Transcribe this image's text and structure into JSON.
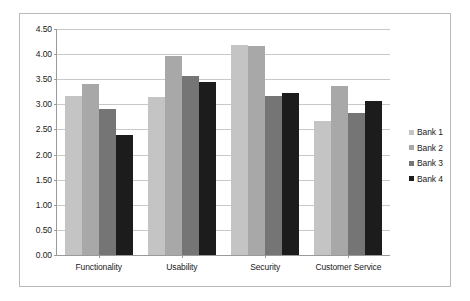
{
  "chart_data": {
    "type": "bar",
    "title": "",
    "subtitle": "",
    "xlabel": "",
    "ylabel": "",
    "ylim": [
      0,
      4.5
    ],
    "ytick_labels": [
      "4.50",
      "4.00",
      "3.50",
      "3.00",
      "2.50",
      "2.00",
      "1.50",
      "1.00",
      "0.50",
      "0.00"
    ],
    "ytick_values": [
      4.5,
      4.0,
      3.5,
      3.0,
      2.5,
      2.0,
      1.5,
      1.0,
      0.5,
      0.0
    ],
    "grid": true,
    "legend_position": "right",
    "categories": [
      "Functionality",
      "Usability",
      "Security",
      "Customer Service"
    ],
    "series": [
      {
        "name": "Bank 1",
        "color": "#c4c4c4",
        "values": [
          3.16,
          3.15,
          4.18,
          2.67
        ]
      },
      {
        "name": "Bank 2",
        "color": "#a8a8a8",
        "values": [
          3.4,
          3.97,
          4.17,
          3.37
        ]
      },
      {
        "name": "Bank 3",
        "color": "#757575",
        "values": [
          2.91,
          3.56,
          3.17,
          2.83
        ]
      },
      {
        "name": "Bank 4",
        "color": "#1c1c1c",
        "values": [
          2.38,
          3.45,
          3.23,
          3.07
        ]
      }
    ]
  },
  "legend": {
    "items": [
      {
        "label": "Bank 1"
      },
      {
        "label": "Bank 2"
      },
      {
        "label": "Bank 3"
      },
      {
        "label": "Bank 4"
      }
    ]
  },
  "colors": {
    "frame_border": "#b9b9b9",
    "axis": "#9a9a9a",
    "gridline": "#c8c8c8",
    "text": "#1a1a1a",
    "background": "#ffffff"
  }
}
